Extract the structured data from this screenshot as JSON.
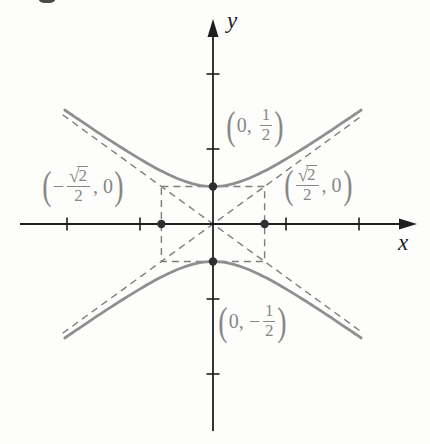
{
  "chart_data": {
    "type": "line",
    "subtype": "hyperbola",
    "orientation": "vertical-transverse-axis",
    "b_semi_transverse": 0.5,
    "a_semi_conjugate": 0.70711,
    "vertices": [
      [
        0,
        0.5
      ],
      [
        0,
        -0.5
      ]
    ],
    "covertex_points": [
      [
        -0.70711,
        0
      ],
      [
        0.70711,
        0
      ]
    ],
    "asymptote_slopes": [
      0.70711,
      -0.70711
    ],
    "central_box": {
      "x": [
        -0.70711,
        0.70711
      ],
      "y": [
        -0.5,
        0.5
      ]
    },
    "x_ticks": [
      -2,
      -1,
      1,
      2
    ],
    "y_ticks": [
      -2,
      -1,
      1,
      2
    ],
    "curve_x_range": [
      -2.03,
      2.03
    ],
    "asymptote_x_range": [
      -2.06,
      2.06
    ],
    "xlim": [
      -2.6,
      2.8
    ],
    "ylim": [
      -2.8,
      2.7
    ],
    "grid": false,
    "xlabel": "x",
    "ylabel": "y"
  },
  "point_labels": {
    "vertex_top": {
      "open": "(",
      "pre": "0, ",
      "num": "1",
      "den": "2",
      "close": ")"
    },
    "vertex_bottom": {
      "open": "(",
      "pre": "0, −",
      "num": "1",
      "den": "2",
      "close": ")"
    },
    "covertex_left": {
      "open": "(",
      "pre": "−",
      "rad": "√",
      "radnum": "2",
      "den": "2",
      "post": ", 0",
      "close": ")"
    },
    "covertex_right": {
      "open": "(",
      "rad": "√",
      "radnum": "2",
      "den": "2",
      "post": ", 0",
      "close": ")"
    }
  },
  "colors": {
    "axis": "#1f1f1f",
    "curve": "#8f8f8f",
    "dashed": "#7e7e7e",
    "dot": "#2f2f2f",
    "label_text": "#878787",
    "axis_letter": "#1c1c1c",
    "background": "#fdfdfb"
  }
}
